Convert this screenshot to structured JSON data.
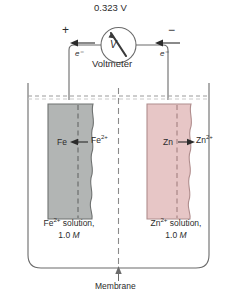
{
  "figure": {
    "voltmeter": {
      "reading": "0.323 V",
      "label": "Voltmeter",
      "dial_symbol": "V"
    },
    "terminals": {
      "left_sign": "+",
      "right_sign": "−"
    },
    "electron_flow": {
      "left_label": "e⁻",
      "right_label": "e⁻",
      "direction": "leftward"
    },
    "left_half_cell": {
      "electrode_label": "Fe",
      "ion_label": "Fe",
      "ion_charge": "2+",
      "reaction_arrow": "←",
      "solution_line1_species": "Fe",
      "solution_line1_charge": "2+",
      "solution_line1_rest": " solution,",
      "solution_line2": "1.0 ",
      "solution_line2_unit": "M",
      "electrode_color": "#b2b5b4",
      "electrode_edge_color": "#6f7271"
    },
    "right_half_cell": {
      "electrode_label": "Zn",
      "ion_label": "Zn",
      "ion_charge": "2+",
      "reaction_arrow": "→",
      "solution_line1_species": "Zn",
      "solution_line1_charge": "2+",
      "solution_line1_rest": " solution,",
      "solution_line2": "1.0 ",
      "solution_line2_unit": "M",
      "electrode_color": "#e7c6c6",
      "electrode_edge_color": "#b08d8d"
    },
    "membrane": {
      "label": "Membrane"
    },
    "colors": {
      "line": "#6b6b6b",
      "text": "#2b2b2b",
      "liquid_surface": "#9a9a9a"
    }
  }
}
